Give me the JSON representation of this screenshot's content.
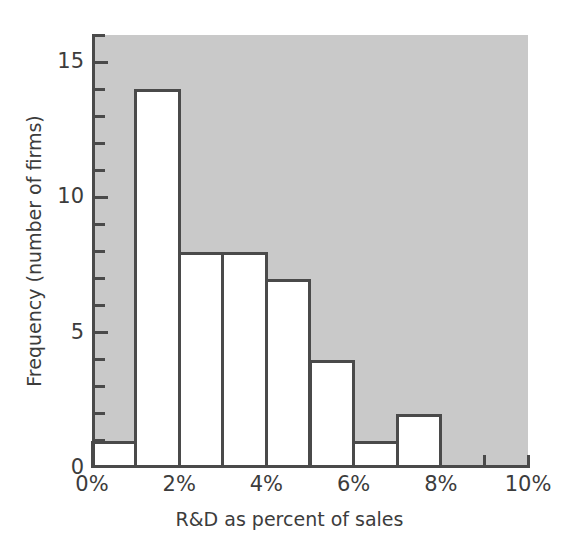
{
  "chart_data": {
    "type": "bar",
    "title": "",
    "subtitle": "",
    "xlabel": "R&D as percent of sales",
    "ylabel": "Frequency (number of firms)",
    "bin_edges": [
      0,
      1,
      2,
      3,
      4,
      5,
      6,
      7,
      8,
      9,
      10
    ],
    "bin_unit": "%",
    "categories": [
      "0-1%",
      "1-2%",
      "2-3%",
      "3-4%",
      "4-5%",
      "5-6%",
      "6-7%",
      "7-8%",
      "8-9%",
      "9-10%"
    ],
    "values": [
      1,
      14,
      8,
      8,
      7,
      4,
      1,
      2,
      0,
      0
    ],
    "xlim": [
      0,
      10
    ],
    "ylim": [
      0,
      16
    ],
    "x_tick_labels": [
      "0%",
      "2%",
      "4%",
      "6%",
      "8%",
      "10%"
    ],
    "x_tick_values": [
      0,
      2,
      4,
      6,
      8,
      10
    ],
    "x_minor_tick_step": 1,
    "y_tick_labels": [
      "0",
      "5",
      "10",
      "15"
    ],
    "y_tick_values": [
      0,
      5,
      10,
      15
    ],
    "y_minor_tick_step": 1,
    "grid": false,
    "legend": null,
    "colors": {
      "plot_background": "#c9c9c9",
      "bar_fill": "#ffffff",
      "bar_outline": "#4a4a4a",
      "axis": "#4a4a4a",
      "text": "#3c3c3c",
      "figure_background": "#ffffff"
    }
  }
}
